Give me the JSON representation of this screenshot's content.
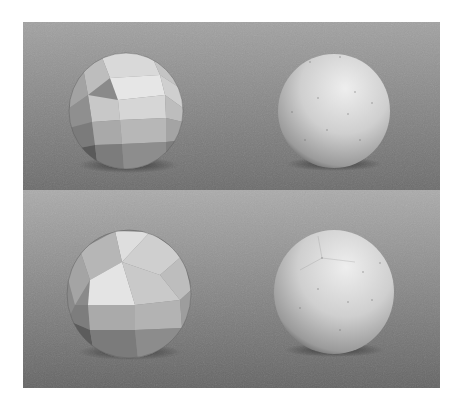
{
  "figure": {
    "colors": {
      "page_background": "#ffffff",
      "top_panel_gradient": [
        "#a2a2a2",
        "#6c6c6c"
      ],
      "bottom_panel_gradient": [
        "#ababab",
        "#646464"
      ],
      "sphere_highlight": "#eeeeee",
      "sphere_shadow": "#3a3a3a"
    },
    "panels": [
      {
        "name": "top",
        "rect": {
          "x": 23,
          "y": 22,
          "w": 417,
          "h": 168
        },
        "spheres": [
          {
            "type": "faceted",
            "cx": 126,
            "cy": 111,
            "r": 57
          },
          {
            "type": "smooth",
            "cx": 334,
            "cy": 111,
            "r": 56
          }
        ]
      },
      {
        "name": "bottom",
        "rect": {
          "x": 23,
          "y": 190,
          "w": 417,
          "h": 198
        },
        "spheres": [
          {
            "type": "faceted-pole",
            "cx": 129,
            "cy": 294,
            "r": 62
          },
          {
            "type": "smooth-pole",
            "cx": 334,
            "cy": 292,
            "r": 60
          }
        ]
      }
    ]
  }
}
